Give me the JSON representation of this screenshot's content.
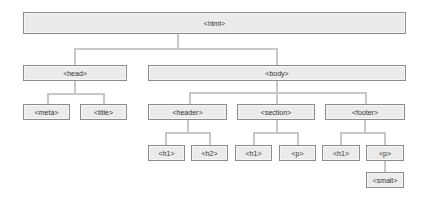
{
  "diagram": {
    "type": "tree",
    "colors": {
      "node_fill": "#ebebeb",
      "node_border": "#8c8c8c",
      "connector": "#c8c8c8",
      "text": "#333333",
      "background": "#ffffff"
    },
    "nodes": {
      "html": {
        "label": "<html>",
        "x": 23,
        "y": 12,
        "w": 383,
        "h": 22
      },
      "head": {
        "label": "<head>",
        "x": 23,
        "y": 65,
        "w": 104,
        "h": 16
      },
      "body": {
        "label": "<body>",
        "x": 148,
        "y": 65,
        "w": 258,
        "h": 16
      },
      "meta": {
        "label": "<meta>",
        "x": 23,
        "y": 104,
        "w": 47,
        "h": 16
      },
      "title": {
        "label": "<title>",
        "x": 80,
        "y": 104,
        "w": 47,
        "h": 16
      },
      "header": {
        "label": "<header>",
        "x": 148,
        "y": 104,
        "w": 79,
        "h": 16
      },
      "section": {
        "label": "<section>",
        "x": 237,
        "y": 104,
        "w": 78,
        "h": 16
      },
      "footer": {
        "label": "<footer>",
        "x": 325,
        "y": 104,
        "w": 80,
        "h": 16
      },
      "header_h1": {
        "label": "<h1>",
        "x": 148,
        "y": 145,
        "w": 37,
        "h": 16
      },
      "header_h2": {
        "label": "<h2>",
        "x": 191,
        "y": 145,
        "w": 37,
        "h": 16
      },
      "section_h1": {
        "label": "<h1>",
        "x": 235,
        "y": 145,
        "w": 37,
        "h": 16
      },
      "section_p": {
        "label": "<p>",
        "x": 279,
        "y": 145,
        "w": 37,
        "h": 16
      },
      "footer_h1": {
        "label": "<h1>",
        "x": 322,
        "y": 145,
        "w": 38,
        "h": 16
      },
      "footer_p": {
        "label": "<p>",
        "x": 366,
        "y": 145,
        "w": 38,
        "h": 16
      },
      "footer_p_small": {
        "label": "<small>",
        "x": 366,
        "y": 172,
        "w": 38,
        "h": 16
      }
    },
    "edges": [
      [
        "html",
        "head"
      ],
      [
        "html",
        "body"
      ],
      [
        "head",
        "meta"
      ],
      [
        "head",
        "title"
      ],
      [
        "body",
        "header"
      ],
      [
        "body",
        "section"
      ],
      [
        "body",
        "footer"
      ],
      [
        "header",
        "header_h1"
      ],
      [
        "header",
        "header_h2"
      ],
      [
        "section",
        "section_h1"
      ],
      [
        "section",
        "section_p"
      ],
      [
        "footer",
        "footer_h1"
      ],
      [
        "footer",
        "footer_p"
      ],
      [
        "footer_p",
        "footer_p_small"
      ]
    ]
  }
}
